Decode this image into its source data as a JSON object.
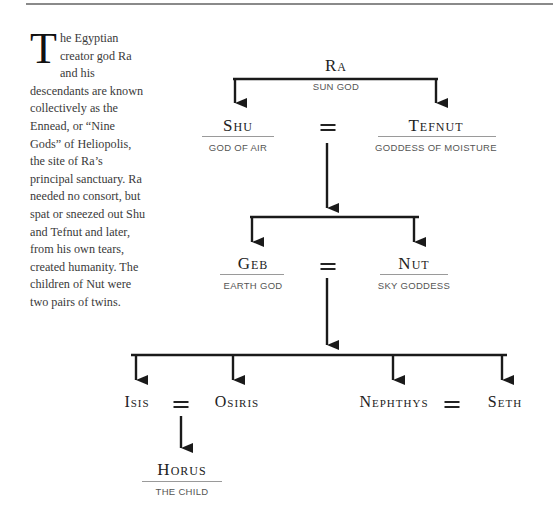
{
  "intro": {
    "drop_cap": "T",
    "text": "he Egyptian creator god Ra and his descendants are known collectively as the Ennead, or “Nine Gods” of Heliopolis, the site of Ra’s principal sanctuary. Ra needed no consort, but spat or sneezed out Shu and Tefnut and later, from his own tears, created humanity. The children of Nut were two pairs of twins."
  },
  "tree": {
    "ra": {
      "name": "Ra",
      "title": "SUN GOD"
    },
    "shu": {
      "name": "Shu",
      "title": "GOD OF AIR"
    },
    "tefnut": {
      "name": "Tefnut",
      "title": "GODDESS OF MOISTURE"
    },
    "geb": {
      "name": "Geb",
      "title": "EARTH GOD"
    },
    "nut": {
      "name": "Nut",
      "title": "SKY GODDESS"
    },
    "isis": {
      "name": "Isis"
    },
    "osiris": {
      "name": "Osiris"
    },
    "nephthys": {
      "name": "Nephthys"
    },
    "seth": {
      "name": "Seth"
    },
    "horus": {
      "name": "Horus",
      "title": "THE CHILD"
    },
    "marriage_symbol": "="
  },
  "colors": {
    "line": "#1a1a1a",
    "rule": "#9a9a9a",
    "caption": "#555555"
  }
}
